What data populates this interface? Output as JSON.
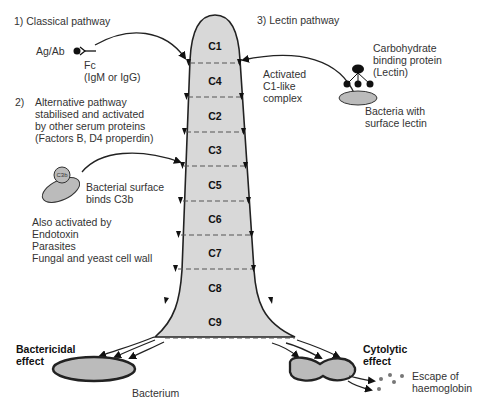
{
  "classical": {
    "title": "1) Classical pathway",
    "agab": "Ag/Ab",
    "fc": "Fc",
    "fc_sub": "(IgM or IgG)"
  },
  "lectin": {
    "title": "3) Lectin pathway",
    "protein_line1": "Carbohydrate",
    "protein_line2": "binding protein",
    "protein_line3": "(Lectin)",
    "activated_line1": "Activated",
    "activated_line2": "C1-like",
    "activated_line3": "complex",
    "bacteria_line1": "Bacteria with",
    "bacteria_line2": "surface lectin"
  },
  "alternative": {
    "number": "2)",
    "line1": "Alternative pathway",
    "line2": "stabilised and activated",
    "line3": "by other serum proteins",
    "line4": "(Factors B, D4 properdin)",
    "c3b_label": "C3b",
    "surface_line1": "Bacterial surface",
    "surface_line2": "binds C3b",
    "also_line1": "Also activated by",
    "also_line2": "Endotoxin",
    "also_line3": "Parasites",
    "also_line4": "Fungal and yeast cell wall"
  },
  "cascade": [
    "C1",
    "C4",
    "C2",
    "C3",
    "C5",
    "C6",
    "C7",
    "C8",
    "C9"
  ],
  "effects": {
    "bactericidal_line1": "Bactericidal",
    "bactericidal_line2": "effect",
    "bacterium": "Bacterium",
    "cytolytic_line1": "Cytolytic",
    "cytolytic_line2": "effect",
    "escape_line1": "Escape of",
    "escape_line2": "haemoglobin"
  },
  "colors": {
    "fill": "#d8d8d8",
    "stroke": "#222222",
    "dash": "#555555"
  }
}
